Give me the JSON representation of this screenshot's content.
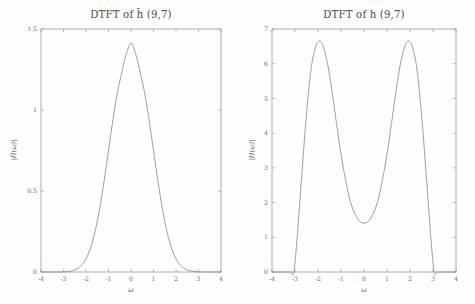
{
  "figure": {
    "background_color": "#fdfdfd",
    "axis_color": "#9a9a9a",
    "curve_color": "#8d8d8d",
    "text_color": "#4a4a4a"
  },
  "chart_data": [
    {
      "type": "line",
      "panel": "left",
      "title": "DTFT of h̃ (9,7)",
      "title_plain": "DTFT of h-tilde (9,7)",
      "xlabel": "ω",
      "ylabel": "|H̃(ω)|",
      "xlim": [
        -4,
        4
      ],
      "ylim": [
        0,
        1.5
      ],
      "xticks": [
        -4,
        -3,
        -2,
        -1,
        0,
        1,
        2,
        3,
        4
      ],
      "xticklabels": [
        "-4",
        "-3",
        "-2",
        "-1",
        "0",
        "1",
        "2",
        "3",
        "4"
      ],
      "yticks": [
        0,
        0.5,
        1,
        1.5
      ],
      "yticklabels": [
        "0",
        "0.5",
        "1",
        "1.5"
      ],
      "grid": false,
      "legend": null,
      "peak_value": 1.41,
      "peak_at": 0,
      "x": [
        -4.0,
        -3.8,
        -3.6,
        -3.4,
        -3.2,
        -3.0,
        -2.8,
        -2.6,
        -2.4,
        -2.2,
        -2.0,
        -1.8,
        -1.6,
        -1.4,
        -1.2,
        -1.0,
        -0.8,
        -0.6,
        -0.4,
        -0.2,
        0.0,
        0.2,
        0.4,
        0.6,
        0.8,
        1.0,
        1.2,
        1.4,
        1.6,
        1.8,
        2.0,
        2.2,
        2.4,
        2.6,
        2.8,
        3.0,
        3.2,
        3.4,
        3.6,
        3.8,
        4.0
      ],
      "values": [
        0.0,
        0.0,
        0.0,
        0.0,
        0.0,
        0.001,
        0.003,
        0.008,
        0.019,
        0.041,
        0.081,
        0.148,
        0.248,
        0.386,
        0.558,
        0.75,
        0.942,
        1.11,
        1.238,
        1.35,
        1.412,
        1.35,
        1.238,
        1.11,
        0.942,
        0.75,
        0.558,
        0.386,
        0.248,
        0.148,
        0.081,
        0.041,
        0.019,
        0.008,
        0.003,
        0.001,
        0.0,
        0.0,
        0.0,
        0.0,
        0.0
      ]
    },
    {
      "type": "line",
      "panel": "right",
      "title": "DTFT of h (9,7)",
      "title_plain": "DTFT of h (9,7)",
      "xlabel": "ω",
      "ylabel": "|H(ω)|",
      "xlim": [
        -4,
        4
      ],
      "ylim": [
        0,
        7
      ],
      "xticks": [
        -4,
        -3,
        -2,
        -1,
        0,
        1,
        2,
        3,
        4
      ],
      "xticklabels": [
        "-4",
        "-3",
        "-2",
        "-1",
        "0",
        "1",
        "2",
        "3",
        "4"
      ],
      "yticks": [
        0,
        1,
        2,
        3,
        4,
        5,
        6,
        7
      ],
      "yticklabels": [
        "0",
        "1",
        "2",
        "3",
        "4",
        "5",
        "6",
        "7"
      ],
      "grid": false,
      "legend": null,
      "peak_value": 6.65,
      "peak_at": [
        -1.95,
        1.95
      ],
      "valley_value": 1.41,
      "valley_at": 0,
      "zeros_at": [
        -3.05,
        3.05
      ],
      "x": [
        -4.0,
        -3.8,
        -3.6,
        -3.4,
        -3.2,
        -3.05,
        -2.9,
        -2.7,
        -2.5,
        -2.3,
        -2.1,
        -1.95,
        -1.8,
        -1.6,
        -1.4,
        -1.2,
        -1.0,
        -0.8,
        -0.6,
        -0.4,
        -0.2,
        0.0,
        0.2,
        0.4,
        0.6,
        0.8,
        1.0,
        1.2,
        1.4,
        1.6,
        1.8,
        1.95,
        2.1,
        2.3,
        2.5,
        2.7,
        2.9,
        3.05,
        3.2,
        3.4,
        3.6,
        3.8,
        4.0
      ],
      "values": [
        0.0,
        0.0,
        0.0,
        0.0,
        0.0,
        0.0,
        1.05,
        2.85,
        4.55,
        5.85,
        6.5,
        6.65,
        6.55,
        6.05,
        5.25,
        4.3,
        3.4,
        2.65,
        2.05,
        1.68,
        1.47,
        1.41,
        1.47,
        1.68,
        2.05,
        2.65,
        3.4,
        4.3,
        5.25,
        6.05,
        6.55,
        6.65,
        6.5,
        5.85,
        4.55,
        2.85,
        1.05,
        0.0,
        0.0,
        0.0,
        0.0,
        0.0,
        0.0
      ]
    }
  ]
}
